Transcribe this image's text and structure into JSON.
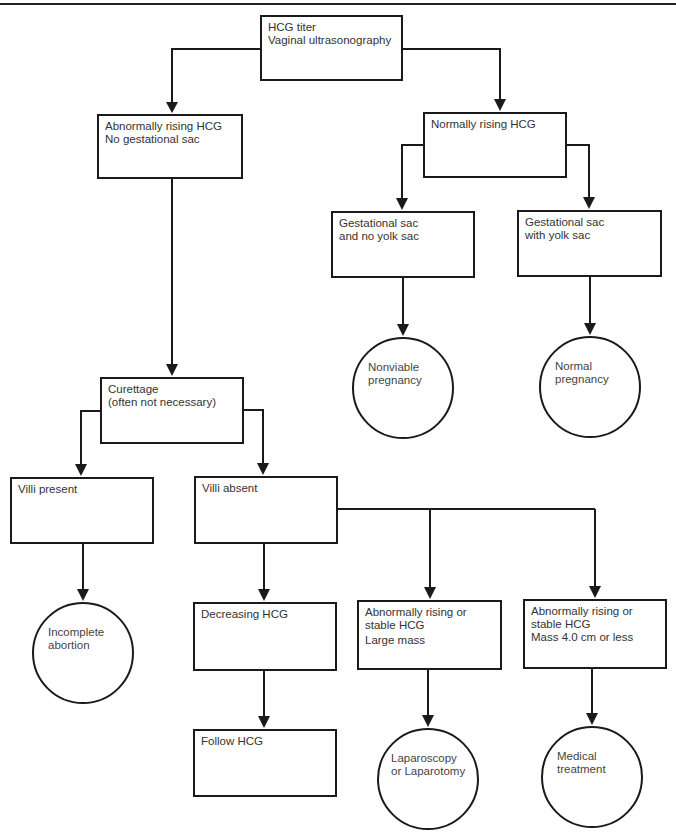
{
  "diagram": {
    "type": "flowchart",
    "nodes": {
      "start": {
        "shape": "box",
        "lines": [
          "HCG titer",
          "Vaginal ultrasonography"
        ]
      },
      "abnormal_rising": {
        "shape": "box",
        "lines": [
          "Abnormally rising HCG",
          "No gestational sac"
        ]
      },
      "normal_rising": {
        "shape": "box",
        "lines": [
          "Normally rising HCG"
        ]
      },
      "sac_no_yolk": {
        "shape": "box",
        "lines": [
          "Gestational sac",
          "and no yolk sac"
        ]
      },
      "sac_with_yolk": {
        "shape": "box",
        "lines": [
          "Gestational sac",
          "with yolk sac"
        ]
      },
      "nonviable": {
        "shape": "circle",
        "lines": [
          "Nonviable",
          "pregnancy"
        ]
      },
      "normal_pregnancy": {
        "shape": "circle",
        "lines": [
          "Normal",
          "pregnancy"
        ]
      },
      "curettage": {
        "shape": "box",
        "lines": [
          "Curettage",
          "(often not necessary)"
        ]
      },
      "villi_present": {
        "shape": "box",
        "lines": [
          "Villi present"
        ]
      },
      "villi_absent": {
        "shape": "box",
        "lines": [
          "Villi absent"
        ]
      },
      "incomplete_abortion": {
        "shape": "circle",
        "lines": [
          "Incomplete",
          "abortion"
        ]
      },
      "decreasing_hcg": {
        "shape": "box",
        "lines": [
          "Decreasing HCG"
        ]
      },
      "large_mass": {
        "shape": "box",
        "lines": [
          "Abnormally rising or",
          "stable HCG",
          "Large mass"
        ]
      },
      "small_mass": {
        "shape": "box",
        "lines": [
          "Abnormally rising or",
          "stable HCG",
          "Mass 4.0 cm or less"
        ]
      },
      "follow_hcg": {
        "shape": "box",
        "lines": [
          "Follow HCG"
        ]
      },
      "laparoscopy": {
        "shape": "circle",
        "lines": [
          "Laparoscopy",
          "or Laparotomy"
        ]
      },
      "medical_treatment": {
        "shape": "circle",
        "lines": [
          "Medical",
          "treatment"
        ]
      }
    },
    "labels": {
      "start": "HCG titer\nVaginal ultrasonography",
      "abnormal_rising": "Abnormally rising HCG\nNo gestational sac",
      "normal_rising": "Normally rising HCG",
      "sac_no_yolk": "Gestational sac\nand no yolk sac",
      "sac_with_yolk": "Gestational sac\nwith yolk sac",
      "nonviable": "Nonviable\npregnancy",
      "normal_pregnancy": "Normal\npregnancy",
      "curettage": "Curettage\n(often not necessary)",
      "villi_present": "Villi present",
      "villi_absent": "Villi absent",
      "incomplete_abortion": "Incomplete\nabortion",
      "decreasing_hcg": "Decreasing HCG",
      "large_mass_1": "Abnormally rising or\nstable HCG",
      "large_mass_2": "Large mass",
      "small_mass": "Abnormally rising or\nstable HCG\nMass 4.0 cm or less",
      "follow_hcg": "Follow HCG",
      "laparoscopy": "Laparoscopy\nor Laparotomy",
      "medical_treatment": "Medical\ntreatment"
    },
    "edges": [
      [
        "start",
        "abnormal_rising"
      ],
      [
        "start",
        "normal_rising"
      ],
      [
        "normal_rising",
        "sac_no_yolk"
      ],
      [
        "normal_rising",
        "sac_with_yolk"
      ],
      [
        "sac_no_yolk",
        "nonviable"
      ],
      [
        "sac_with_yolk",
        "normal_pregnancy"
      ],
      [
        "abnormal_rising",
        "curettage"
      ],
      [
        "curettage",
        "villi_present"
      ],
      [
        "curettage",
        "villi_absent"
      ],
      [
        "villi_present",
        "incomplete_abortion"
      ],
      [
        "villi_absent",
        "decreasing_hcg"
      ],
      [
        "villi_absent",
        "large_mass"
      ],
      [
        "villi_absent",
        "small_mass"
      ],
      [
        "decreasing_hcg",
        "follow_hcg"
      ],
      [
        "large_mass",
        "laparoscopy"
      ],
      [
        "small_mass",
        "medical_treatment"
      ]
    ],
    "colors": {
      "stroke": "#1a1a1a",
      "text": "#333333",
      "background": "#ffffff"
    }
  }
}
